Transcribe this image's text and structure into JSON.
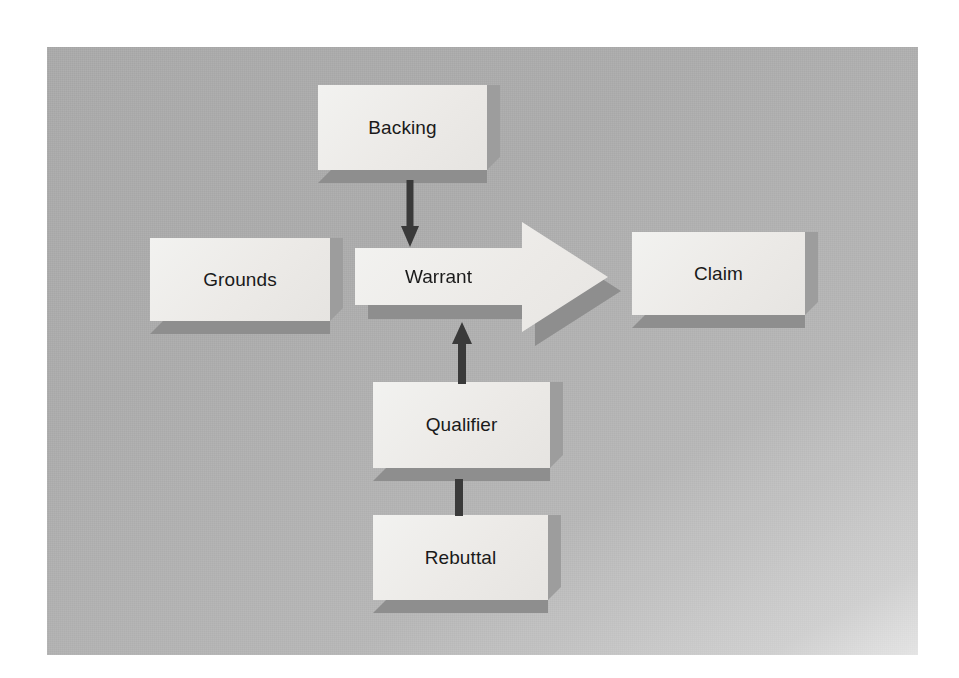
{
  "diagram": {
    "canvas": {
      "background_color": "#ababab",
      "node_fill_color": "#eceae7",
      "node_shadow_color": "#8e8e8e",
      "connector_color": "#3a3a3a"
    },
    "nodes": [
      {
        "id": "backing",
        "label": "Backing",
        "shape": "3d-box"
      },
      {
        "id": "grounds",
        "label": "Grounds",
        "shape": "3d-box"
      },
      {
        "id": "warrant",
        "label": "Warrant",
        "shape": "3d-block-arrow-right"
      },
      {
        "id": "claim",
        "label": "Claim",
        "shape": "3d-box"
      },
      {
        "id": "qualifier",
        "label": "Qualifier",
        "shape": "3d-box"
      },
      {
        "id": "rebuttal",
        "label": "Rebuttal",
        "shape": "3d-box"
      }
    ],
    "connectors": [
      {
        "id": "backing-to-warrant",
        "from": "backing",
        "to": "warrant",
        "style": "arrow-down"
      },
      {
        "id": "qualifier-to-warrant",
        "from": "qualifier",
        "to": "warrant",
        "style": "arrow-up"
      },
      {
        "id": "rebuttal-to-qualifier",
        "from": "rebuttal",
        "to": "qualifier",
        "style": "line"
      },
      {
        "id": "warrant-to-claim",
        "from": "warrant",
        "to": "claim",
        "style": "block-arrow-right"
      }
    ]
  }
}
